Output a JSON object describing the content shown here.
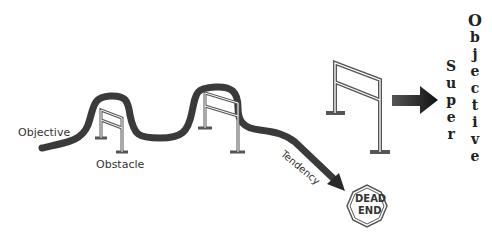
{
  "diagram": {
    "labels": {
      "objective": "Objective",
      "obstacle": "Obstacle",
      "tendency": "Tendency",
      "dead_end_line1": "DEAD",
      "dead_end_line2": "END"
    },
    "super_word": [
      "S",
      "u",
      "p",
      "e",
      "r"
    ],
    "objective_word": [
      "O",
      "b",
      "j",
      "e",
      "c",
      "t",
      "i",
      "v",
      "e"
    ],
    "colors": {
      "path": "#3a3a3a",
      "hurdle": "#555555",
      "arrow": "#2a2a2a",
      "text": "#333333"
    }
  }
}
